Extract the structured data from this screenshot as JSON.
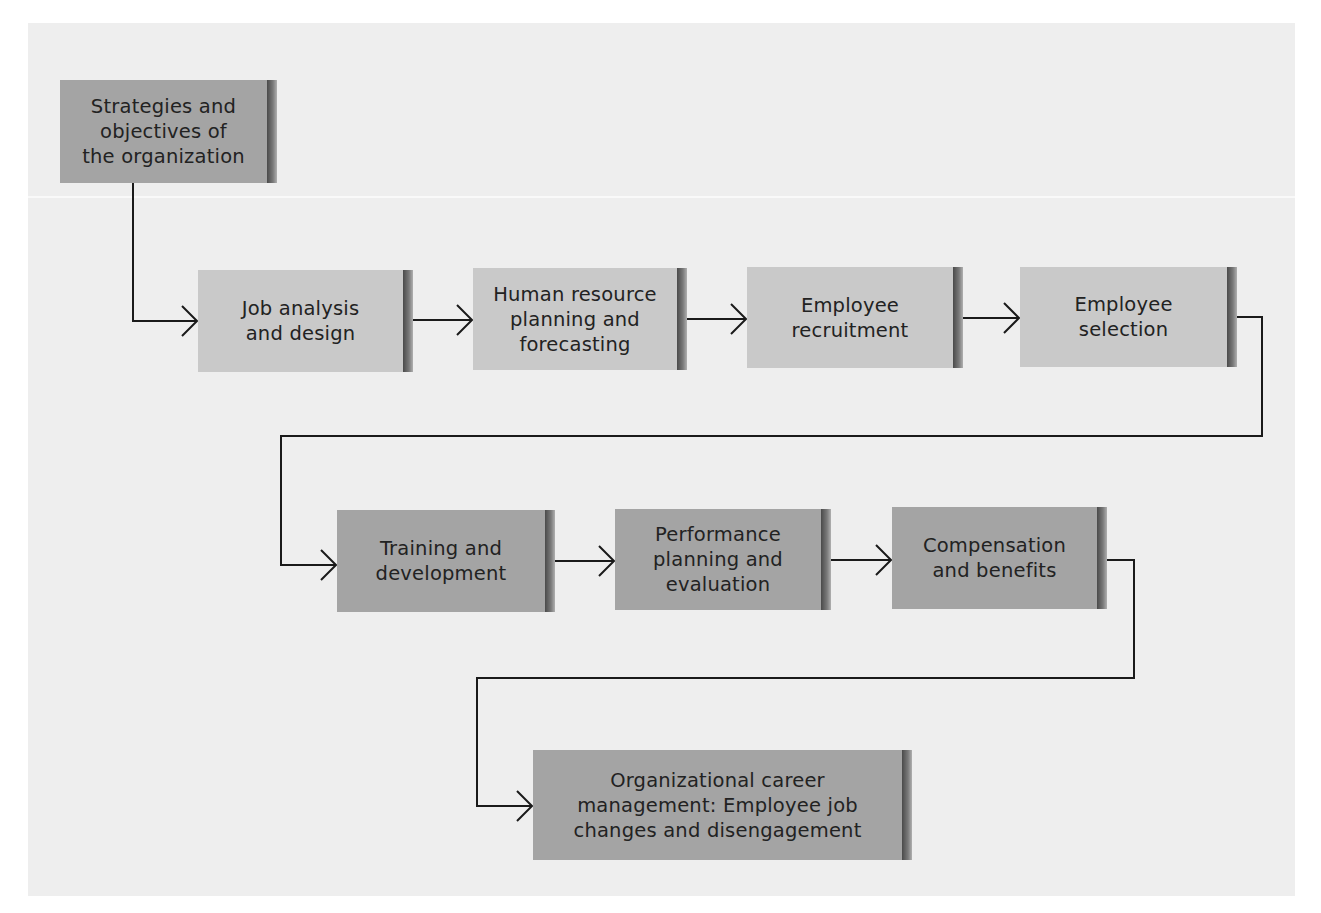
{
  "diagram": {
    "type": "flowchart",
    "colors": {
      "panel_background": "#eeeeee",
      "box_light": "#c9c9c9",
      "box_dark": "#a4a4a4",
      "connector": "#1a1a1a",
      "text": "#222222"
    },
    "nodes": [
      {
        "id": "strategies",
        "label": "Strategies and\nobjectives of\nthe organization",
        "shade": "dark"
      },
      {
        "id": "job-analysis",
        "label": "Job analysis\nand design",
        "shade": "light"
      },
      {
        "id": "hr-planning",
        "label": "Human resource\nplanning and\nforecasting",
        "shade": "light"
      },
      {
        "id": "recruitment",
        "label": "Employee\nrecruitment",
        "shade": "light"
      },
      {
        "id": "selection",
        "label": "Employee\nselection",
        "shade": "light"
      },
      {
        "id": "training",
        "label": "Training and\ndevelopment",
        "shade": "dark"
      },
      {
        "id": "performance",
        "label": "Performance\nplanning and\nevaluation",
        "shade": "dark"
      },
      {
        "id": "compensation",
        "label": "Compensation\nand benefits",
        "shade": "dark"
      },
      {
        "id": "career",
        "label": "Organizational career\nmanagement: Employee job\nchanges and disengagement",
        "shade": "dark"
      }
    ],
    "edges": [
      {
        "from": "strategies",
        "to": "job-analysis"
      },
      {
        "from": "job-analysis",
        "to": "hr-planning"
      },
      {
        "from": "hr-planning",
        "to": "recruitment"
      },
      {
        "from": "recruitment",
        "to": "selection"
      },
      {
        "from": "selection",
        "to": "training"
      },
      {
        "from": "training",
        "to": "performance"
      },
      {
        "from": "performance",
        "to": "compensation"
      },
      {
        "from": "compensation",
        "to": "career"
      }
    ]
  }
}
